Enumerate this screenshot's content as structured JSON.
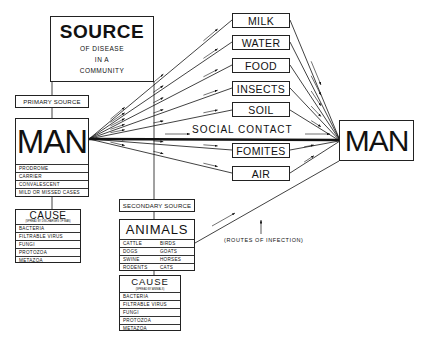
{
  "source": {
    "title": "SOURCE",
    "subtitle_lines": [
      "OF DISEASE",
      "IN A",
      "COMMUNITY"
    ]
  },
  "primary_source": {
    "label": "PRIMARY SOURCE",
    "man": {
      "title": "MAN",
      "stages": [
        "PRODROME",
        "CARRIER",
        "CONVALESCENT",
        "MILD OR MISSED CASES"
      ]
    },
    "cause": {
      "title": "CAUSE",
      "subtitle": "(SPREAD BY DISCHARGES OF MAN)",
      "items": [
        "BACTERIA",
        "FILTRABLE VIRUS",
        "FUNGI",
        "PROTOZOA",
        "METAZOA"
      ]
    }
  },
  "secondary_source": {
    "label": "SECONDARY SOURCE",
    "animals": {
      "title": "ANIMALS",
      "rows": [
        [
          "CATTLE",
          "BIRDS"
        ],
        [
          "DOGS",
          "GOATS"
        ],
        [
          "SWINE",
          "HORSES"
        ],
        [
          "RODENTS",
          "CATS"
        ]
      ]
    },
    "cause": {
      "title": "CAUSE",
      "subtitle": "(SPREAD BY ANIMALS)",
      "items": [
        "BACTERIA",
        "FILTRABLE VIRUS",
        "FUNGI",
        "PROTOZOA",
        "METAZOA"
      ]
    }
  },
  "routes": [
    "MILK",
    "WATER",
    "FOOD",
    "INSECTS",
    "SOIL",
    "FOMITES",
    "AIR"
  ],
  "social_contact": "SOCIAL CONTACT",
  "target": {
    "title": "MAN"
  },
  "routes_annotation": "(ROUTES OF INFECTION)",
  "colors": {
    "ink": "#111111",
    "background": "#ffffff"
  }
}
